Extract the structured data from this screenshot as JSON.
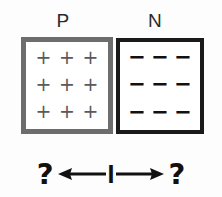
{
  "diagram": {
    "type": "semiconductor-pn-junction",
    "background_color": "#fdfdfd"
  },
  "regions": [
    {
      "id": "p-region",
      "label": "P",
      "carrier_symbol": "+",
      "carrier_name": "positive-charge",
      "rows": 3,
      "columns": 3,
      "carrier_count": 9,
      "border_color": "#6d6d6d",
      "symbol_color": "#5a5a5a",
      "carriers": [
        [
          "+",
          "+",
          "+"
        ],
        [
          "+",
          "+",
          "+"
        ],
        [
          "+",
          "+",
          "+"
        ]
      ]
    },
    {
      "id": "n-region",
      "label": "N",
      "carrier_symbol": "−",
      "carrier_name": "negative-charge",
      "rows": 3,
      "columns": 3,
      "carrier_count": 9,
      "border_color": "#1a1a1a",
      "symbol_color": "#111111",
      "carriers": [
        [
          "−",
          "−",
          "−"
        ],
        [
          "−",
          "−",
          "−"
        ],
        [
          "−",
          "−",
          "−"
        ]
      ]
    }
  ],
  "current_annotation": {
    "left_question": "?",
    "left_arrow_direction": "left",
    "current_symbol": "I",
    "right_arrow_direction": "right",
    "right_question": "?",
    "color": "#111111"
  }
}
